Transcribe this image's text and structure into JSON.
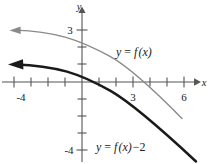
{
  "figure": {
    "title": "",
    "axes": {
      "x_axis_label": "x",
      "y_axis_label": "y",
      "x_ticks": [
        {
          "value": -4,
          "label": "-4",
          "px": 14,
          "labeled": true
        },
        {
          "value": -3,
          "label": "",
          "px": 31,
          "labeled": false
        },
        {
          "value": -2,
          "label": "",
          "px": 48,
          "labeled": false
        },
        {
          "value": -1,
          "label": "",
          "px": 65,
          "labeled": false
        },
        {
          "value": 1,
          "label": "",
          "px": 99,
          "labeled": false
        },
        {
          "value": 2,
          "label": "",
          "px": 116,
          "labeled": false
        },
        {
          "value": 3,
          "label": "3",
          "px": 133,
          "labeled": true
        },
        {
          "value": 4,
          "label": "",
          "px": 150,
          "labeled": false
        },
        {
          "value": 5,
          "label": "",
          "px": 167,
          "labeled": false
        },
        {
          "value": 6,
          "label": "6",
          "px": 184,
          "labeled": true
        }
      ],
      "y_ticks": [
        {
          "value": 3,
          "label": "3",
          "px": 30,
          "labeled": true
        },
        {
          "value": 2,
          "label": "",
          "px": 47,
          "labeled": false
        },
        {
          "value": 1,
          "label": "",
          "px": 64,
          "labeled": false
        },
        {
          "value": -1,
          "label": "",
          "px": 99,
          "labeled": false
        },
        {
          "value": -2,
          "label": "",
          "px": 116,
          "labeled": false
        },
        {
          "value": -3,
          "label": "",
          "px": 133,
          "labeled": false
        },
        {
          "value": -4,
          "label": "-4",
          "px": 150,
          "labeled": true
        }
      ],
      "origin_px": {
        "x": 82,
        "y": 82
      },
      "unit_px": 17,
      "x_range": [
        -4.8,
        6.7
      ],
      "y_range": [
        -4.0,
        3.4
      ],
      "grid": false,
      "arrowheads": [
        "x-positive",
        "y-positive"
      ]
    },
    "curves": [
      {
        "name": "f",
        "label": "y = f(x)",
        "label_parts": {
          "lhs": "y",
          "eq": "=",
          "fn": "f",
          "arg": "(x)"
        },
        "label_px": {
          "x": 116,
          "y": 52
        },
        "color": "#8a8a8a",
        "stroke_width": 1.35,
        "arrow_end": "left",
        "x_intercept": 3.5,
        "y_intercept": 2.0,
        "points": [
          {
            "x": -4.5,
            "y": 3.05
          },
          {
            "x": -3.5,
            "y": 3.0
          },
          {
            "x": -2.5,
            "y": 2.88
          },
          {
            "x": -1.5,
            "y": 2.68
          },
          {
            "x": -0.5,
            "y": 2.32
          },
          {
            "x": 0.0,
            "y": 2.05
          },
          {
            "x": 1.0,
            "y": 1.5
          },
          {
            "x": 2.0,
            "y": 0.9
          },
          {
            "x": 3.0,
            "y": 0.3
          },
          {
            "x": 3.5,
            "y": 0.0
          },
          {
            "x": 4.5,
            "y": -0.7
          },
          {
            "x": 5.5,
            "y": -1.5
          },
          {
            "x": 6.2,
            "y": -2.15
          }
        ]
      },
      {
        "name": "f-minus-2",
        "label": "y = f(x) - 2",
        "label_parts": {
          "lhs": "y",
          "eq": "=",
          "fn": "f",
          "arg": "(x)",
          "shift": "−2"
        },
        "label_px": {
          "x": 96,
          "y": 147
        },
        "color": "#1a1a1a",
        "stroke_width": 2.5,
        "arrow_end": "left",
        "x_intercept": 0.1,
        "y_intercept": 0.05,
        "points": [
          {
            "x": -4.5,
            "y": 1.05
          },
          {
            "x": -3.5,
            "y": 1.0
          },
          {
            "x": -2.5,
            "y": 0.88
          },
          {
            "x": -1.5,
            "y": 0.68
          },
          {
            "x": -0.5,
            "y": 0.32
          },
          {
            "x": 0.0,
            "y": 0.05
          },
          {
            "x": 1.0,
            "y": -0.5
          },
          {
            "x": 2.0,
            "y": -1.1
          },
          {
            "x": 3.0,
            "y": -1.7
          },
          {
            "x": 4.0,
            "y": -2.4
          },
          {
            "x": 5.0,
            "y": -3.15
          },
          {
            "x": 6.0,
            "y": -3.95
          },
          {
            "x": 6.6,
            "y": -4.5
          }
        ]
      }
    ]
  }
}
